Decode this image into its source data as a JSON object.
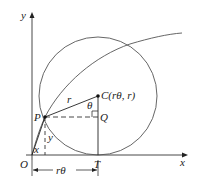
{
  "diagram": {
    "type": "cycloid-geometry",
    "axes": {
      "x_label": "x",
      "y_label": "y",
      "origin_label": "O"
    },
    "points": {
      "P": "P",
      "C": "C(rθ, r)",
      "Q": "Q",
      "T": "T"
    },
    "segment_labels": {
      "radius": "r",
      "angle": "θ",
      "x_segment": "x",
      "y_segment": "y",
      "arc_length": "rθ"
    },
    "colors": {
      "line": "#222222",
      "curve": "#555555",
      "background": "#ffffff"
    }
  }
}
